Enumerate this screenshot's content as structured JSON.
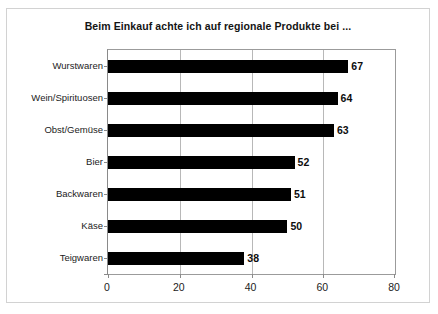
{
  "chart_data": {
    "type": "bar",
    "orientation": "horizontal",
    "title": "Beim Einkauf achte ich auf regionale Produkte bei ...",
    "xlabel": "",
    "ylabel": "",
    "categories": [
      "Wurstwaren",
      "Wein/Spirituosen",
      "Obst/Gemüse",
      "Bier",
      "Backwaren",
      "Käse",
      "Teigwaren"
    ],
    "values": [
      67,
      64,
      63,
      52,
      51,
      50,
      38
    ],
    "data_labels": [
      "67",
      "64",
      "63",
      "52",
      "51",
      "50",
      "38"
    ],
    "xlim": [
      0,
      80
    ],
    "xticks": [
      0,
      20,
      40,
      60,
      80
    ],
    "xtick_labels": [
      "0",
      "20",
      "40",
      "60",
      "80"
    ],
    "grid": "vertical",
    "legend": "none",
    "bar_color": "#000000",
    "gridline_color": "#b8b8b8",
    "axis_color": "#8a8a8a",
    "frame_color": "#d2d2d2",
    "background": "#ffffff"
  }
}
